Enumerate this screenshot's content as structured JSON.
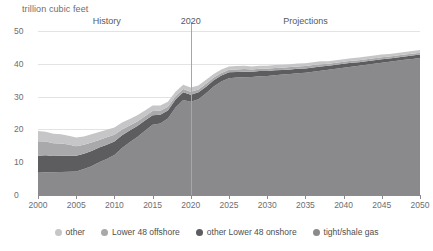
{
  "chart_data": {
    "type": "area",
    "title": "",
    "subtitle": "",
    "unit_label": "trillion cubic feet",
    "xlabel": "",
    "ylabel": "trillion cubic feet",
    "stacked": true,
    "grid": true,
    "legend_position": "bottom",
    "xlim": [
      2000,
      2050
    ],
    "ylim": [
      0,
      50
    ],
    "yticks": [
      0,
      10,
      20,
      30,
      40,
      50
    ],
    "xticks": [
      2000,
      2005,
      2010,
      2015,
      2020,
      2025,
      2030,
      2035,
      2040,
      2045,
      2050
    ],
    "x": [
      2000,
      2001,
      2002,
      2003,
      2004,
      2005,
      2006,
      2007,
      2008,
      2009,
      2010,
      2011,
      2012,
      2013,
      2014,
      2015,
      2016,
      2017,
      2018,
      2019,
      2020,
      2021,
      2022,
      2023,
      2024,
      2025,
      2026,
      2027,
      2028,
      2029,
      2030,
      2031,
      2032,
      2033,
      2034,
      2035,
      2036,
      2037,
      2038,
      2039,
      2040,
      2041,
      2042,
      2043,
      2044,
      2045,
      2046,
      2047,
      2048,
      2049,
      2050
    ],
    "series": [
      {
        "name": "tight/shale gas",
        "color": "#8a8a8c",
        "values": [
          6.8,
          6.9,
          6.9,
          7.0,
          7.1,
          7.2,
          7.9,
          8.8,
          10.0,
          11.0,
          12.2,
          14.3,
          16.1,
          17.7,
          19.6,
          21.4,
          21.8,
          23.3,
          26.7,
          29.0,
          28.4,
          29.2,
          31.0,
          33.1,
          34.6,
          35.6,
          35.8,
          35.9,
          36.0,
          36.2,
          36.3,
          36.5,
          36.7,
          36.9,
          37.1,
          37.3,
          37.6,
          37.9,
          38.2,
          38.5,
          38.8,
          39.1,
          39.4,
          39.7,
          40.0,
          40.3,
          40.6,
          40.9,
          41.2,
          41.5,
          41.8
        ]
      },
      {
        "name": "other Lower 48 onshore",
        "color": "#5d5d5f",
        "values": [
          5.2,
          5.2,
          5.0,
          5.0,
          4.9,
          4.8,
          4.7,
          4.6,
          4.5,
          4.3,
          4.1,
          3.9,
          3.6,
          3.3,
          3.1,
          2.9,
          2.7,
          2.5,
          2.4,
          2.3,
          2.2,
          2.1,
          2.0,
          1.9,
          1.8,
          1.8,
          1.7,
          1.7,
          1.6,
          1.6,
          1.5,
          1.5,
          1.4,
          1.4,
          1.4,
          1.3,
          1.3,
          1.3,
          1.2,
          1.2,
          1.2,
          1.2,
          1.1,
          1.1,
          1.1,
          1.1,
          1.0,
          1.0,
          1.0,
          1.0,
          1.0
        ]
      },
      {
        "name": "Lower 48 offshore",
        "color": "#a9a9ab",
        "values": [
          4.4,
          4.2,
          3.9,
          3.7,
          3.4,
          2.9,
          2.7,
          2.6,
          2.3,
          2.3,
          2.1,
          1.8,
          1.5,
          1.4,
          1.3,
          1.3,
          1.2,
          1.1,
          1.0,
          1.0,
          0.9,
          0.9,
          0.9,
          0.8,
          0.8,
          0.8,
          0.8,
          0.8,
          0.7,
          0.7,
          0.7,
          0.7,
          0.7,
          0.7,
          0.7,
          0.7,
          0.7,
          0.7,
          0.6,
          0.6,
          0.6,
          0.6,
          0.6,
          0.6,
          0.6,
          0.6,
          0.6,
          0.6,
          0.6,
          0.6,
          0.6
        ]
      },
      {
        "name": "other",
        "color": "#c6c6c8",
        "values": [
          3.1,
          3.0,
          2.9,
          2.8,
          2.7,
          2.6,
          2.5,
          2.5,
          2.4,
          2.3,
          2.2,
          2.1,
          2.0,
          1.9,
          1.8,
          1.7,
          1.6,
          1.5,
          1.4,
          1.3,
          1.3,
          1.2,
          1.2,
          1.1,
          1.1,
          1.0,
          1.0,
          1.0,
          0.9,
          0.9,
          0.9,
          0.9,
          0.9,
          0.9,
          0.9,
          0.9,
          0.9,
          0.9,
          0.8,
          0.8,
          0.8,
          0.8,
          0.8,
          0.8,
          0.8,
          0.8,
          0.8,
          0.8,
          0.8,
          0.8,
          0.8
        ]
      }
    ],
    "annotations": [
      {
        "text": "History",
        "x": 2009
      },
      {
        "text": "2020",
        "x": 2020
      },
      {
        "text": "Projections",
        "x": 2035
      }
    ],
    "divider_x": 2020
  },
  "legend": {
    "items": [
      {
        "label": "other",
        "color": "#c6c6c8"
      },
      {
        "label": "Lower 48 offshore",
        "color": "#a9a9ab"
      },
      {
        "label": "other Lower 48 onshore",
        "color": "#5d5d5f"
      },
      {
        "label": "tight/shale gas",
        "color": "#8a8a8c"
      }
    ]
  }
}
